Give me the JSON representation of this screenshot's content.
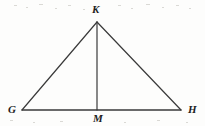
{
  "figure": {
    "kind": "geometry-diagram",
    "shape": "triangle-with-altitude",
    "background_color": "#fdfdfc",
    "stroke_color": "#3a3a3a",
    "label_color": "#1e1e1e",
    "stroke_width": 1.2,
    "width": 205,
    "height": 126,
    "labels": {
      "apex": "K",
      "base_left": "G",
      "base_right": "H",
      "base_midpoint": "M"
    },
    "points": {
      "K": {
        "x": 97,
        "y": 22
      },
      "G": {
        "x": 22,
        "y": 110
      },
      "H": {
        "x": 181,
        "y": 110
      },
      "M": {
        "x": 97,
        "y": 110
      }
    },
    "segments": [
      {
        "name": "side-GK",
        "from": "G",
        "to": "K"
      },
      {
        "name": "side-KH",
        "from": "K",
        "to": "H"
      },
      {
        "name": "base-GH",
        "from": "G",
        "to": "H"
      },
      {
        "name": "altitude-KM",
        "from": "K",
        "to": "M"
      }
    ]
  }
}
